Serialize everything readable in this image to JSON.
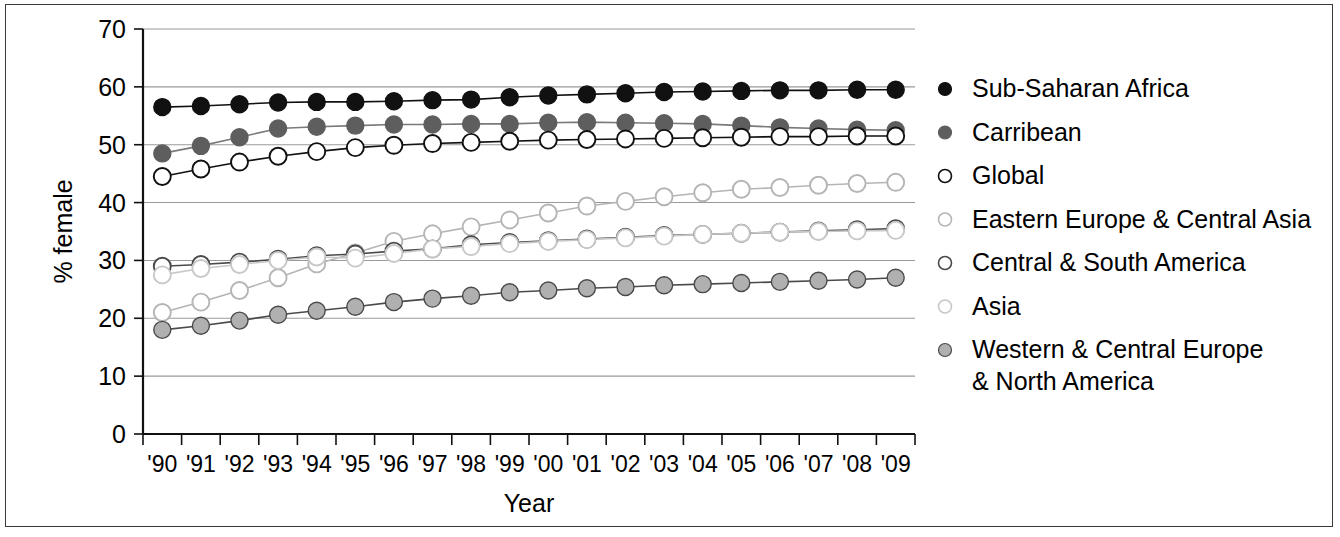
{
  "chart_data": {
    "type": "line",
    "title": "",
    "xlabel": "Year",
    "ylabel": "% female",
    "ylim": [
      0,
      70
    ],
    "ytick_values": [
      0,
      10,
      20,
      30,
      40,
      50,
      60,
      70
    ],
    "ytick_labels": [
      "0",
      "10",
      "20",
      "30",
      "40",
      "50",
      "60",
      "70"
    ],
    "grid": "horizontal",
    "legend_position": "right",
    "x": [
      1990,
      1991,
      1992,
      1993,
      1994,
      1995,
      1996,
      1997,
      1998,
      1999,
      2000,
      2001,
      2002,
      2003,
      2004,
      2005,
      2006,
      2007,
      2008,
      2009
    ],
    "categories": [
      "'90",
      "'91",
      "'92",
      "'93",
      "'94",
      "'95",
      "'96",
      "'97",
      "'98",
      "'99",
      "'00",
      "'01",
      "'02",
      "'03",
      "'04",
      "'05",
      "'06",
      "'07",
      "'08",
      "'09"
    ],
    "series": [
      {
        "name": "Sub-Saharan Africa",
        "marker": "filled-circle",
        "fill": "#111111",
        "stroke": "#111111",
        "line": "#111111",
        "values": [
          56.5,
          56.7,
          57.0,
          57.3,
          57.4,
          57.4,
          57.5,
          57.7,
          57.8,
          58.2,
          58.5,
          58.7,
          58.9,
          59.1,
          59.2,
          59.3,
          59.4,
          59.4,
          59.5,
          59.5
        ]
      },
      {
        "name": "Carribean",
        "marker": "filled-circle",
        "fill": "#5e5e5e",
        "stroke": "#5e5e5e",
        "line": "#7a7a7a",
        "values": [
          48.5,
          49.8,
          51.3,
          52.8,
          53.1,
          53.3,
          53.5,
          53.5,
          53.6,
          53.6,
          53.8,
          53.9,
          53.8,
          53.7,
          53.6,
          53.3,
          53.0,
          52.8,
          52.6,
          52.5
        ]
      },
      {
        "name": "Global",
        "marker": "open-circle",
        "fill": "#ffffff",
        "stroke": "#111111",
        "line": "#111111",
        "values": [
          44.5,
          45.8,
          47.0,
          48.0,
          48.8,
          49.5,
          49.9,
          50.2,
          50.4,
          50.6,
          50.8,
          50.9,
          51.0,
          51.1,
          51.2,
          51.3,
          51.4,
          51.4,
          51.5,
          51.5
        ]
      },
      {
        "name": "Eastern Europe & Central Asia",
        "marker": "open-circle",
        "fill": "#ffffff",
        "stroke": "#b5b5b5",
        "line": "#b5b5b5",
        "values": [
          21.0,
          22.8,
          24.8,
          27.0,
          29.4,
          31.3,
          33.3,
          34.6,
          35.8,
          37.0,
          38.2,
          39.4,
          40.2,
          41.0,
          41.7,
          42.3,
          42.6,
          43.0,
          43.3,
          43.5
        ]
      },
      {
        "name": "Central & South America",
        "marker": "open-circle",
        "fill": "#ffffff",
        "stroke": "#4a4a4a",
        "line": "#4a4a4a",
        "values": [
          29.0,
          29.3,
          29.7,
          30.2,
          30.8,
          31.1,
          31.6,
          32.0,
          32.7,
          33.1,
          33.4,
          33.7,
          34.0,
          34.3,
          34.5,
          34.7,
          34.9,
          35.1,
          35.3,
          35.5
        ]
      },
      {
        "name": "Asia",
        "marker": "open-circle",
        "fill": "#ffffff",
        "stroke": "#c8c8c8",
        "line": "#c8c8c8",
        "values": [
          27.5,
          28.6,
          29.3,
          30.0,
          30.6,
          30.4,
          31.2,
          32.0,
          32.4,
          32.9,
          33.3,
          33.6,
          33.9,
          34.2,
          34.5,
          34.7,
          34.9,
          35.0,
          35.1,
          35.2
        ]
      },
      {
        "name": "Western & Central Europe & North America",
        "marker": "filled-circle",
        "fill": "#b0b0b0",
        "stroke": "#4a4a4a",
        "line": "#4a4a4a",
        "values": [
          18.0,
          18.7,
          19.6,
          20.6,
          21.3,
          22.0,
          22.8,
          23.4,
          23.9,
          24.5,
          24.8,
          25.2,
          25.4,
          25.7,
          25.9,
          26.1,
          26.3,
          26.5,
          26.7,
          27.0
        ]
      }
    ],
    "legend_entries": [
      {
        "label": "Sub-Saharan Africa",
        "label2": ""
      },
      {
        "label": "Carribean",
        "label2": ""
      },
      {
        "label": "Global",
        "label2": ""
      },
      {
        "label": "Eastern Europe & Central Asia",
        "label2": ""
      },
      {
        "label": "Central & South America",
        "label2": ""
      },
      {
        "label": "Asia",
        "label2": ""
      },
      {
        "label": "Western & Central Europe",
        "label2": "& North America"
      }
    ]
  }
}
